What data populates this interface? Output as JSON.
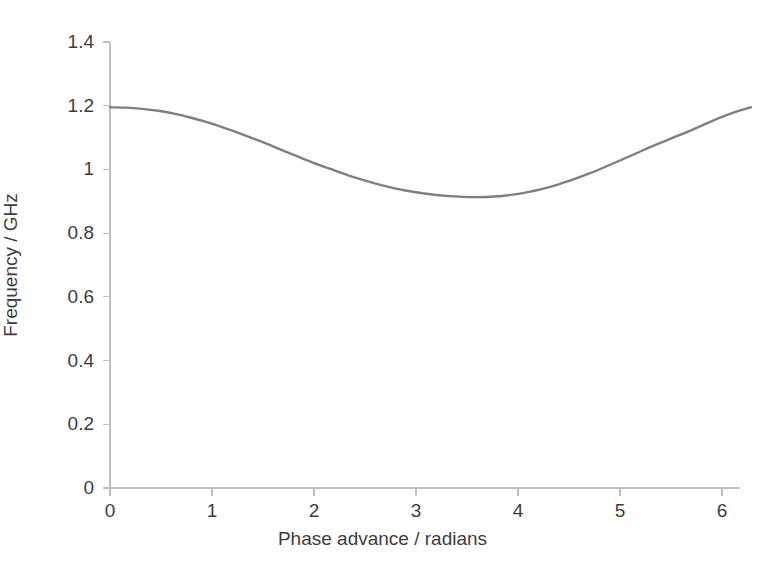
{
  "chart_data": {
    "type": "line",
    "title": "",
    "xlabel": "Phase advance / radians",
    "ylabel": "Frequency / GHz",
    "xlim": [
      0,
      6.2832
    ],
    "ylim": [
      0,
      1.4
    ],
    "xticks": [
      0,
      1,
      2,
      3,
      4,
      5,
      6
    ],
    "xtick_labels": [
      "0",
      "1",
      "2",
      "3",
      "4",
      "5",
      "6"
    ],
    "yticks": [
      0,
      0.2,
      0.4,
      0.6,
      0.8,
      1,
      1.2,
      1.4
    ],
    "ytick_labels": [
      "0",
      "0.2",
      "0.4",
      "0.6",
      "0.8",
      "1",
      "1.2",
      "1.4"
    ],
    "grid": false,
    "legend": false,
    "legend_position": "none",
    "series": [
      {
        "name": "Dispersion curve",
        "color": "#7f7f7f",
        "line_width": 2.4,
        "x": [
          0.0,
          0.1571,
          0.3142,
          0.4712,
          0.6283,
          0.7854,
          0.9425,
          1.0996,
          1.2566,
          1.4137,
          1.5708,
          1.7279,
          1.885,
          2.042,
          2.1991,
          2.3562,
          2.5133,
          2.6704,
          2.8274,
          2.9845,
          3.1416,
          3.2987,
          3.4558,
          3.6128,
          3.7699,
          3.927,
          4.0841,
          4.2412,
          4.3982,
          4.5553,
          4.7124,
          4.8695,
          5.0265,
          5.1836,
          5.3407,
          5.4978,
          5.6549,
          5.8119,
          5.969,
          6.1261,
          6.2832
        ],
        "y": [
          1.195,
          1.194,
          1.19,
          1.184,
          1.175,
          1.163,
          1.149,
          1.133,
          1.115,
          1.096,
          1.076,
          1.055,
          1.035,
          1.015,
          0.997,
          0.979,
          0.964,
          0.95,
          0.938,
          0.929,
          0.922,
          0.917,
          0.914,
          0.913,
          0.915,
          0.92,
          0.928,
          0.939,
          0.953,
          0.97,
          0.989,
          1.01,
          1.032,
          1.054,
          1.076,
          1.097,
          1.117,
          1.139,
          1.161,
          1.18,
          1.195
        ]
      }
    ],
    "annotations": [],
    "notes": {
      "min_value": 0.88,
      "max_value": 1.2,
      "min_at_x": 3.14,
      "axis_color": "#bfbfbf",
      "text_color": "#3d3d3d",
      "background": "#ffffff"
    }
  },
  "axes": {
    "x_title": "Phase advance / radians",
    "y_title": "Frequency / GHz"
  }
}
